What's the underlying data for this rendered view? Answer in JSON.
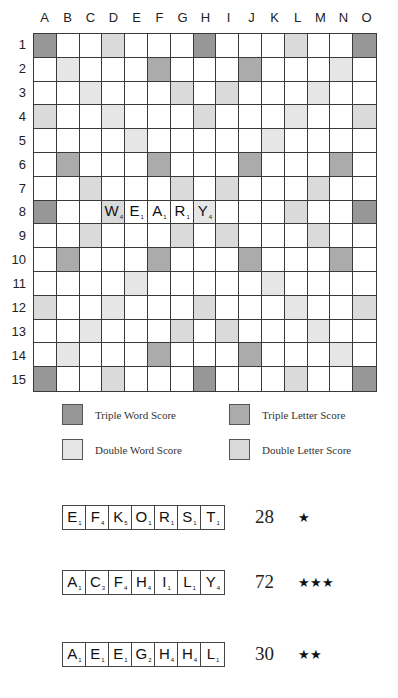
{
  "board": {
    "columns": [
      "A",
      "B",
      "C",
      "D",
      "E",
      "F",
      "G",
      "H",
      "I",
      "J",
      "K",
      "L",
      "M",
      "N",
      "O"
    ],
    "rows": [
      "1",
      "2",
      "3",
      "4",
      "5",
      "6",
      "7",
      "8",
      "9",
      "10",
      "11",
      "12",
      "13",
      "14",
      "15"
    ],
    "layout": [
      [
        "TW",
        "",
        "",
        "DL",
        "",
        "",
        "",
        "TW",
        "",
        "",
        "",
        "DL",
        "",
        "",
        "TW"
      ],
      [
        "",
        "DW",
        "",
        "",
        "",
        "TL",
        "",
        "",
        "",
        "TL",
        "",
        "",
        "",
        "DW",
        ""
      ],
      [
        "",
        "",
        "DW",
        "",
        "",
        "",
        "DL",
        "",
        "DL",
        "",
        "",
        "",
        "DW",
        "",
        ""
      ],
      [
        "DL",
        "",
        "",
        "DW",
        "",
        "",
        "",
        "DL",
        "",
        "",
        "",
        "DW",
        "",
        "",
        "DL"
      ],
      [
        "",
        "",
        "",
        "",
        "DW",
        "",
        "",
        "",
        "",
        "",
        "DW",
        "",
        "",
        "",
        ""
      ],
      [
        "",
        "TL",
        "",
        "",
        "",
        "TL",
        "",
        "",
        "",
        "TL",
        "",
        "",
        "",
        "TL",
        ""
      ],
      [
        "",
        "",
        "DL",
        "",
        "",
        "",
        "DL",
        "",
        "DL",
        "",
        "",
        "",
        "DL",
        "",
        ""
      ],
      [
        "TW",
        "",
        "",
        "DL",
        "",
        "",
        "",
        "DW",
        "",
        "",
        "",
        "DL",
        "",
        "",
        "TW"
      ],
      [
        "",
        "",
        "DL",
        "",
        "",
        "",
        "DL",
        "",
        "DL",
        "",
        "",
        "",
        "DL",
        "",
        ""
      ],
      [
        "",
        "TL",
        "",
        "",
        "",
        "TL",
        "",
        "",
        "",
        "TL",
        "",
        "",
        "",
        "TL",
        ""
      ],
      [
        "",
        "",
        "",
        "",
        "DW",
        "",
        "",
        "",
        "",
        "",
        "DW",
        "",
        "",
        "",
        ""
      ],
      [
        "DL",
        "",
        "",
        "DW",
        "",
        "",
        "",
        "DL",
        "",
        "",
        "",
        "DW",
        "",
        "",
        "DL"
      ],
      [
        "",
        "",
        "DW",
        "",
        "",
        "",
        "DL",
        "",
        "DL",
        "",
        "",
        "",
        "DW",
        "",
        ""
      ],
      [
        "",
        "DW",
        "",
        "",
        "",
        "TL",
        "",
        "",
        "",
        "TL",
        "",
        "",
        "",
        "DW",
        ""
      ],
      [
        "TW",
        "",
        "",
        "DL",
        "",
        "",
        "",
        "TW",
        "",
        "",
        "",
        "DL",
        "",
        "",
        "TW"
      ]
    ],
    "placed_word": {
      "word": "WEARY",
      "row": 8,
      "start_column": "D",
      "tiles": [
        {
          "letter": "W",
          "value": "4",
          "col": 3
        },
        {
          "letter": "E",
          "value": "1",
          "col": 4
        },
        {
          "letter": "A",
          "value": "1",
          "col": 5
        },
        {
          "letter": "R",
          "value": "1",
          "col": 6
        },
        {
          "letter": "Y",
          "value": "4",
          "col": 7
        }
      ]
    }
  },
  "legend": {
    "items": [
      {
        "key": "TW",
        "label": "Triple Word Score",
        "color": "#979797"
      },
      {
        "key": "TL",
        "label": "Triple Letter Score",
        "color": "#ababab"
      },
      {
        "key": "DW",
        "label": "Double Word Score",
        "color": "#e6e6e6"
      },
      {
        "key": "DL",
        "label": "Double Letter Score",
        "color": "#dadada"
      }
    ]
  },
  "racks": [
    {
      "tiles": [
        {
          "letter": "E",
          "value": "1"
        },
        {
          "letter": "F",
          "value": "4"
        },
        {
          "letter": "K",
          "value": "5"
        },
        {
          "letter": "O",
          "value": "1"
        },
        {
          "letter": "R",
          "value": "1"
        },
        {
          "letter": "S",
          "value": "1"
        },
        {
          "letter": "T",
          "value": "1"
        }
      ],
      "score": "28",
      "stars": "★"
    },
    {
      "tiles": [
        {
          "letter": "A",
          "value": "1"
        },
        {
          "letter": "C",
          "value": "3"
        },
        {
          "letter": "F",
          "value": "4"
        },
        {
          "letter": "H",
          "value": "4"
        },
        {
          "letter": "I",
          "value": "1"
        },
        {
          "letter": "L",
          "value": "1"
        },
        {
          "letter": "Y",
          "value": "4"
        }
      ],
      "score": "72",
      "stars": "★★★"
    },
    {
      "tiles": [
        {
          "letter": "A",
          "value": "1"
        },
        {
          "letter": "E",
          "value": "1"
        },
        {
          "letter": "E",
          "value": "1"
        },
        {
          "letter": "G",
          "value": "2"
        },
        {
          "letter": "H",
          "value": "4"
        },
        {
          "letter": "H",
          "value": "4"
        },
        {
          "letter": "L",
          "value": "1"
        }
      ],
      "score": "30",
      "stars": "★★"
    }
  ]
}
